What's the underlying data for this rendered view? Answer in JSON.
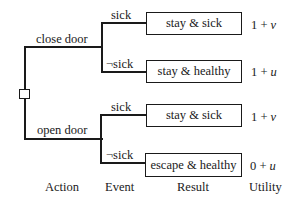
{
  "diagram": {
    "type": "decision-tree",
    "root": {
      "node_type": "decision"
    },
    "actions": [
      {
        "label": "close door",
        "events": [
          {
            "label": "sick",
            "result": "stay & sick",
            "utility": {
              "base": "1",
              "op": "+",
              "var": "v"
            }
          },
          {
            "label": "¬sick",
            "result": "stay & healthy",
            "utility": {
              "base": "1",
              "op": "+",
              "var": "u"
            }
          }
        ]
      },
      {
        "label": "open door",
        "events": [
          {
            "label": "sick",
            "result": "stay & sick",
            "utility": {
              "base": "1",
              "op": "+",
              "var": "v"
            }
          },
          {
            "label": "¬sick",
            "result": "escape & healthy",
            "utility": {
              "base": "0",
              "op": "+",
              "var": "u"
            }
          }
        ]
      }
    ],
    "column_headers": {
      "action": "Action",
      "event": "Event",
      "result": "Result",
      "utility": "Utility"
    }
  }
}
